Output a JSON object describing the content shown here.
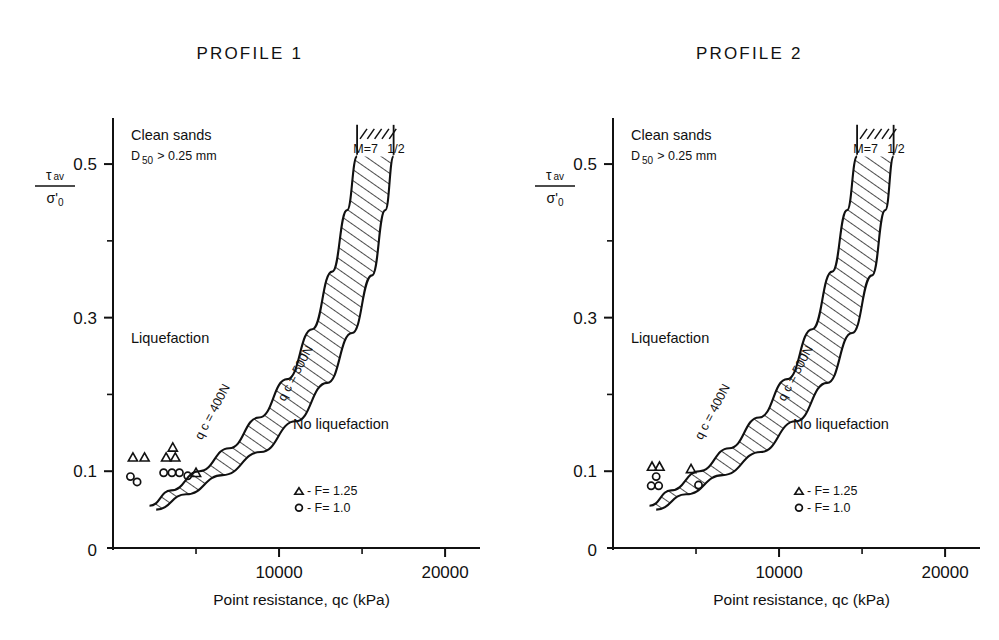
{
  "figure": {
    "background_color": "#ffffff",
    "ink_color": "#111111"
  },
  "panels": [
    {
      "title": "PROFILE 1",
      "annotations": {
        "clean_sands": "Clean sands",
        "d50_prefix": "D",
        "d50_sub": "50",
        "d50_rest": "> 0.25 mm",
        "liquefaction": "Liquefaction",
        "no_liquefaction": "No liquefaction",
        "magnitude": "M=7",
        "magnitude_frac": "1/2"
      },
      "curve_labels": {
        "left": "q c  =  400N",
        "right": "q c  =  500N"
      },
      "legend": [
        {
          "marker": "triangle",
          "label": "- F=  1.25"
        },
        {
          "marker": "circle",
          "label": "- F=  1.0"
        }
      ]
    },
    {
      "title": "PROFILE 2",
      "annotations": {
        "clean_sands": "Clean sands",
        "d50_prefix": "D",
        "d50_sub": "50",
        "d50_rest": "> 0.25 mm",
        "liquefaction": "Liquefaction",
        "no_liquefaction": "No liquefaction",
        "magnitude": "M=7",
        "magnitude_frac": "1/2"
      },
      "curve_labels": {
        "left": "q c  =  400N",
        "right": "q c  =  500N"
      },
      "legend": [
        {
          "marker": "triangle",
          "label": "- F=  1.25"
        },
        {
          "marker": "circle",
          "label": "- F=  1.0"
        }
      ]
    }
  ],
  "axes": {
    "y_numerator_sym": "τ",
    "y_numerator_sub": "av",
    "y_denominator_sym": "σ'",
    "y_denominator_sub": "0",
    "x_title": "Point resistance, qc (kPa)",
    "x_ticks_major": [
      0,
      10000,
      20000
    ],
    "x_ticks_major_labels": [
      "0",
      "10000",
      "20000"
    ],
    "x_ticks_minor": [
      5000,
      15000
    ],
    "y_ticks_major": [
      0.1,
      0.3,
      0.5
    ],
    "y_ticks_major_labels": [
      "0.1",
      "0.3",
      "0.5"
    ],
    "y_ticks_minor": [
      0.2,
      0.4
    ],
    "y_zero_label": "0",
    "xlim": [
      0,
      21500
    ],
    "ylim": [
      0,
      0.56
    ]
  },
  "chart_data": {
    "type": "line",
    "xlabel": "Point resistance, qc (kPa)",
    "ylabel": "tau av / sigma'0",
    "xlim": [
      0,
      21500
    ],
    "ylim": [
      0,
      0.56
    ],
    "grid": false,
    "legend_position": "inside-lower-right",
    "charts": [
      {
        "name": "PROFILE 1",
        "series": [
          {
            "name": "qc = 400N",
            "comment": "left boundary of hatched band",
            "x": [
              2200,
              3500,
              5200,
              7000,
              8800,
              10500,
              12000,
              13200,
              14100,
              14700
            ],
            "y": [
              0.055,
              0.075,
              0.1,
              0.13,
              0.17,
              0.22,
              0.285,
              0.36,
              0.44,
              0.51
            ]
          },
          {
            "name": "qc = 500N",
            "comment": "right boundary of hatched band",
            "x": [
              2600,
              4400,
              6600,
              8900,
              11000,
              12900,
              14400,
              15600,
              16400,
              16900
            ],
            "y": [
              0.05,
              0.07,
              0.095,
              0.125,
              0.165,
              0.215,
              0.28,
              0.355,
              0.44,
              0.51
            ]
          }
        ],
        "scatter": [
          {
            "name": "F = 1.25",
            "marker": "triangle",
            "x": [
              1200,
              1900,
              3200,
              3750,
              3600,
              5000
            ],
            "y": [
              0.118,
              0.118,
              0.118,
              0.118,
              0.131,
              0.098
            ]
          },
          {
            "name": "F = 1.0",
            "marker": "circle",
            "x": [
              1050,
              1450,
              3050,
              3550,
              4000,
              4500
            ],
            "y": [
              0.093,
              0.086,
              0.098,
              0.098,
              0.098,
              0.094
            ]
          }
        ],
        "band_fill": "diagonal-hatch"
      },
      {
        "name": "PROFILE 2",
        "series": [
          {
            "name": "qc = 400N",
            "comment": "left boundary of hatched band",
            "x": [
              2200,
              3500,
              5200,
              7000,
              8800,
              10500,
              12000,
              13200,
              14100,
              14700
            ],
            "y": [
              0.055,
              0.075,
              0.1,
              0.13,
              0.17,
              0.22,
              0.285,
              0.36,
              0.44,
              0.51
            ]
          },
          {
            "name": "qc = 500N",
            "comment": "right boundary of hatched band",
            "x": [
              2600,
              4400,
              6600,
              8900,
              11000,
              12900,
              14400,
              15600,
              16400,
              16900
            ],
            "y": [
              0.05,
              0.07,
              0.095,
              0.125,
              0.165,
              0.215,
              0.28,
              0.355,
              0.44,
              0.51
            ]
          }
        ],
        "scatter": [
          {
            "name": "F = 1.25",
            "marker": "triangle",
            "x": [
              2350,
              2800,
              4700
            ],
            "y": [
              0.106,
              0.106,
              0.103
            ]
          },
          {
            "name": "F = 1.0",
            "marker": "circle",
            "x": [
              2600,
              2300,
              2750,
              5150
            ],
            "y": [
              0.093,
              0.081,
              0.081,
              0.082
            ]
          }
        ],
        "band_fill": "diagonal-hatch"
      }
    ]
  }
}
